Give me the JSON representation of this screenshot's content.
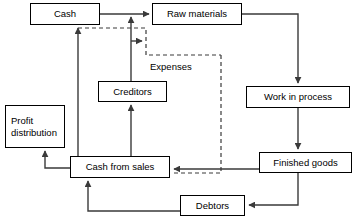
{
  "diagram": {
    "line_color": "#3a3a3a",
    "box_border_color": "#000000",
    "background": "#ffffff",
    "nodes": [
      {
        "id": "cash",
        "label": "Cash",
        "x": 30,
        "y": 3,
        "w": 70,
        "h": 22
      },
      {
        "id": "raw-materials",
        "label": "Raw materials",
        "x": 152,
        "y": 3,
        "w": 90,
        "h": 22
      },
      {
        "id": "creditors",
        "label": "Creditors",
        "x": 98,
        "y": 81,
        "w": 69,
        "h": 21
      },
      {
        "id": "work-in-process",
        "label": "Work in process",
        "x": 246,
        "y": 86,
        "w": 104,
        "h": 22
      },
      {
        "id": "profit-distribution",
        "label": "Profit distribution",
        "x": 5,
        "y": 105,
        "w": 60,
        "h": 43
      },
      {
        "id": "finished-goods",
        "label": "Finished goods",
        "x": 259,
        "y": 152,
        "w": 93,
        "h": 21
      },
      {
        "id": "cash-from-sales",
        "label": "Cash from sales",
        "x": 70,
        "y": 156,
        "w": 100,
        "h": 22
      },
      {
        "id": "debtors",
        "label": "Debtors",
        "x": 180,
        "y": 195,
        "w": 65,
        "h": 21
      }
    ],
    "free_labels": [
      {
        "id": "expenses",
        "label": "Expenses",
        "x": 148,
        "y": 61
      }
    ],
    "edges": [
      {
        "id": "cash-to-raw-materials",
        "from": "cash",
        "to": "raw-materials",
        "style": "solid",
        "label": ""
      },
      {
        "id": "raw-materials-to-work-in-process",
        "from": "raw-materials",
        "to": "work-in-process",
        "style": "solid",
        "label": ""
      },
      {
        "id": "work-in-process-to-finished-goods",
        "from": "work-in-process",
        "to": "finished-goods",
        "style": "solid",
        "label": ""
      },
      {
        "id": "finished-goods-to-debtors",
        "from": "finished-goods",
        "to": "debtors",
        "style": "solid",
        "label": ""
      },
      {
        "id": "finished-goods-to-cash-from-sales",
        "from": "finished-goods",
        "to": "cash-from-sales",
        "style": "solid",
        "label": ""
      },
      {
        "id": "debtors-to-cash-from-sales",
        "from": "debtors",
        "to": "cash-from-sales",
        "style": "solid",
        "label": ""
      },
      {
        "id": "cash-from-sales-to-profit-distribution",
        "from": "cash-from-sales",
        "to": "profit-distribution",
        "style": "solid",
        "label": ""
      },
      {
        "id": "cash-from-sales-to-cash",
        "from": "cash-from-sales",
        "to": "cash",
        "style": "solid",
        "label": ""
      },
      {
        "id": "cash-from-sales-to-creditors",
        "from": "cash-from-sales",
        "to": "creditors",
        "style": "solid",
        "label": ""
      },
      {
        "id": "creditors-to-expenses",
        "from": "creditors",
        "to": "expenses",
        "style": "solid",
        "label": ""
      },
      {
        "id": "cash-to-expenses",
        "from": "cash",
        "to": "expenses",
        "style": "dashed",
        "label": "Expenses"
      },
      {
        "id": "expenses-to-cash-from-sales",
        "from": "expenses",
        "to": "cash-from-sales",
        "style": "dashed",
        "label": ""
      }
    ]
  }
}
